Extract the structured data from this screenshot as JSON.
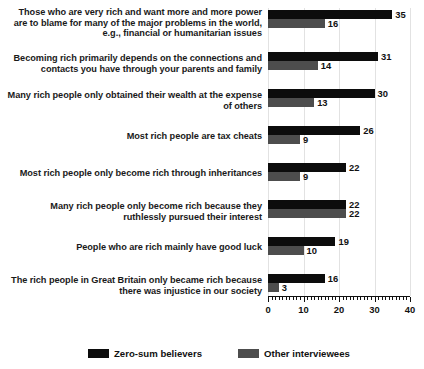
{
  "chart_data": {
    "type": "bar",
    "orientation": "horizontal",
    "title": "",
    "subtitle": "",
    "xlabel": "",
    "ylabel": "",
    "xlim": [
      0,
      40
    ],
    "xticks": [
      0,
      10,
      20,
      30,
      40
    ],
    "xtick_labels": [
      "0",
      "10",
      "20",
      "30",
      "40"
    ],
    "minor_tick_step": 1,
    "grid": true,
    "grid_axis": "x",
    "legend_position": "bottom",
    "categories": [
      "Those who are very rich and want more and more power are to blame for many of the major problems in the world, e.g., financial or humanitarian issues",
      "Becoming rich primarily depends on the connections and contacts you have through your parents and family",
      "Many rich people only obtained their wealth at the expense of others",
      "Most rich people are tax cheats",
      "Most rich people only become rich through inheritances",
      "Many rich people only become rich because they ruthlessly pursued their interest",
      "People who are rich mainly have good luck",
      "The rich people in Great Britain only became rich because there was injustice in our society"
    ],
    "series": [
      {
        "name": "Zero-sum believers",
        "color": "#0c0c0c",
        "values": [
          35,
          31,
          30,
          26,
          22,
          22,
          19,
          16
        ]
      },
      {
        "name": "Other interviewees",
        "color": "#4d4d4d",
        "values": [
          16,
          14,
          13,
          9,
          9,
          22,
          10,
          3
        ]
      }
    ]
  },
  "legend": {
    "items": [
      {
        "label": "Zero-sum believers",
        "color": "#0c0c0c",
        "icon": "square-swatch-icon"
      },
      {
        "label": "Other interviewees",
        "color": "#4d4d4d",
        "icon": "square-swatch-icon"
      }
    ]
  }
}
